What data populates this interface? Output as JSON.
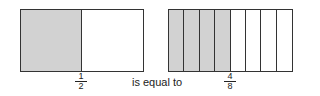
{
  "left_model": {
    "parts": 2,
    "shaded": 1,
    "fraction": {
      "numerator": "1",
      "denominator": "2"
    }
  },
  "middle_text": "is equal to",
  "right_model": {
    "parts": 8,
    "shaded": 4,
    "fraction": {
      "numerator": "4",
      "denominator": "8"
    }
  },
  "colors": {
    "shaded": "#d2d2d2",
    "unshaded": "#ffffff",
    "outline": "#333333"
  }
}
